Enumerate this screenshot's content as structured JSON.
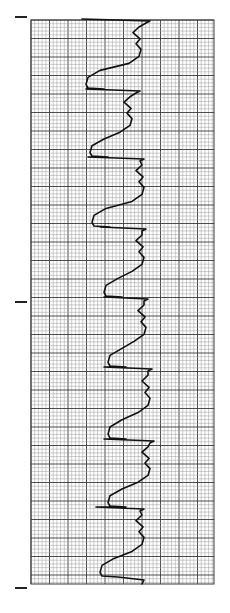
{
  "figure": {
    "type": "ecg-rhythm-strip",
    "orientation": "vertical",
    "background": "#ffffff",
    "grid": {
      "left": 31,
      "top": 20,
      "right": 214,
      "bottom": 584,
      "minor_spacing": 3.7,
      "major_every": 5,
      "minor_color": "#9a9a9a",
      "major_color": "#3a3a3a"
    },
    "trace_color": "#111111",
    "markers": [
      {
        "x": 15,
        "y": 17,
        "width": 12
      },
      {
        "x": 15,
        "y": 302,
        "width": 12
      },
      {
        "x": 15,
        "y": 588,
        "width": 12
      }
    ],
    "beats": [
      {
        "start": 20,
        "baseline": 137,
        "s_x": 148,
        "q_x": 86
      },
      {
        "start": 90,
        "baseline": 128,
        "s_x": 138,
        "q_x": 90
      },
      {
        "start": 158,
        "baseline": 140,
        "s_x": 142,
        "q_x": 92
      },
      {
        "start": 228,
        "baseline": 140,
        "s_x": 144,
        "q_x": 104
      },
      {
        "start": 298,
        "baseline": 142,
        "s_x": 146,
        "q_x": 108
      },
      {
        "start": 368,
        "baseline": 146,
        "s_x": 150,
        "q_x": 108
      },
      {
        "start": 440,
        "baseline": 146,
        "s_x": 152,
        "q_x": 108
      },
      {
        "start": 508,
        "baseline": 140,
        "s_x": 142,
        "q_x": 100
      }
    ],
    "end_y": 578
  }
}
